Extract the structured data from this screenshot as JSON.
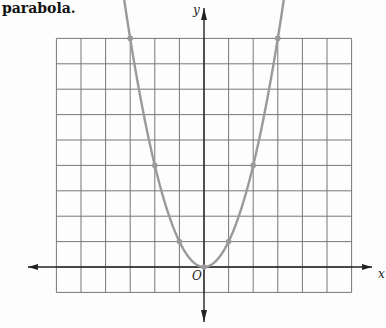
{
  "caption": "parabola.",
  "axes": {
    "x_label": "x",
    "y_label": "y",
    "origin_label": "O"
  },
  "grid": {
    "x_min": -6,
    "x_max": 6,
    "y_min": -1,
    "y_max": 9,
    "step": 1
  },
  "colors": {
    "curve": "#9a9a9a",
    "grid": "#777777",
    "axis": "#222222"
  },
  "chart_data": {
    "type": "line",
    "title": "",
    "equation": "y = x^2",
    "xlabel": "x",
    "ylabel": "y",
    "xlim": [
      -6,
      6
    ],
    "ylim": [
      -1,
      9
    ],
    "grid": true,
    "points": [
      {
        "x": -3,
        "y": 9
      },
      {
        "x": -2,
        "y": 4
      },
      {
        "x": -1,
        "y": 1
      },
      {
        "x": 0,
        "y": 0
      },
      {
        "x": 1,
        "y": 1
      },
      {
        "x": 2,
        "y": 4
      },
      {
        "x": 3,
        "y": 9
      }
    ]
  }
}
